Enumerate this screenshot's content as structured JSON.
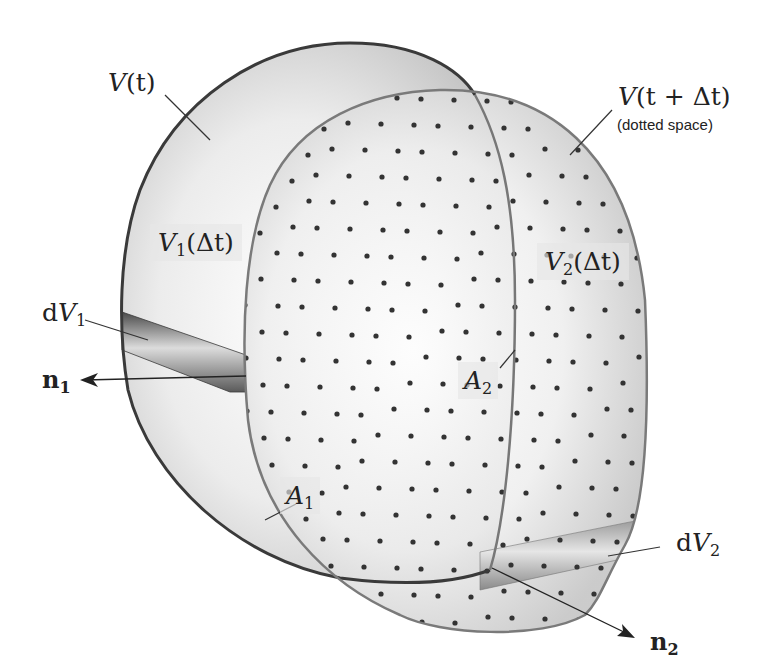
{
  "figure": {
    "colors": {
      "background": "#ffffff",
      "vt_outline": "#3a3a3a",
      "vtdt_outline": "#7a7a7a",
      "fill_light": "#f4f4f4",
      "fill_shade": "#c8c8c8",
      "dot": "#333333",
      "tube_dark": "#555555",
      "tube_light": "#d8d8d8"
    }
  },
  "labels": {
    "V_t": {
      "main": "V",
      "arg": "(t)"
    },
    "V_t_dt": {
      "main": "V",
      "arg": "(t + Δt)",
      "note": "(dotted space)"
    },
    "V1_dt": {
      "main": "V",
      "sub": "1",
      "arg": "(Δt)"
    },
    "V2_dt": {
      "main": "V",
      "sub": "2",
      "arg": "(Δt)"
    },
    "dV1": {
      "prefix": "d",
      "main": "V",
      "sub": "1"
    },
    "dV2": {
      "prefix": "d",
      "main": "V",
      "sub": "2"
    },
    "n1": {
      "main": "n",
      "sub": "1"
    },
    "n2": {
      "main": "n",
      "sub": "2"
    },
    "A1": {
      "main": "A",
      "sub": "1"
    },
    "A2": {
      "main": "A",
      "sub": "2"
    }
  }
}
